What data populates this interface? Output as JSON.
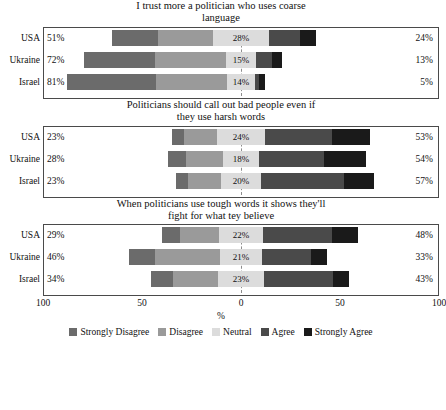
{
  "chart_data": {
    "type": "bar",
    "subtype": "diverging-stacked-likert",
    "title": "",
    "xlabel": "%",
    "ylabel": "",
    "xlim": [
      -100,
      100
    ],
    "xticks": [
      -100,
      -50,
      0,
      50,
      100
    ],
    "xticklabels": [
      "100",
      "50",
      "0",
      "50",
      "100"
    ],
    "grid": false,
    "legend_position": "bottom",
    "legend": [
      {
        "name": "Strongly Disagree",
        "color": "#6b6b6b"
      },
      {
        "name": "Disagree",
        "color": "#9a9a9a"
      },
      {
        "name": "Neutral",
        "color": "#dcdcdc"
      },
      {
        "name": "Agree",
        "color": "#4a4a4a"
      },
      {
        "name": "Strongly Agree",
        "color": "#1a1a1a"
      }
    ],
    "categories": [
      "USA",
      "Ukraine",
      "Israel"
    ],
    "panels": [
      {
        "title_lines": [
          "I trust more a politician who uses coarse",
          "language"
        ],
        "title": "I trust more a politician who uses coarse language",
        "rows": [
          {
            "category": "USA",
            "disagree_total_label": "51%",
            "neutral_label": "28%",
            "agree_total_label": "24%",
            "values": {
              "strongly_disagree": 23,
              "disagree": 28,
              "neutral": 28,
              "agree": 16,
              "strongly_agree": 8
            }
          },
          {
            "category": "Ukraine",
            "disagree_total_label": "72%",
            "neutral_label": "15%",
            "agree_total_label": "13%",
            "values": {
              "strongly_disagree": 36,
              "disagree": 36,
              "neutral": 15,
              "agree": 8,
              "strongly_agree": 5
            }
          },
          {
            "category": "Israel",
            "disagree_total_label": "81%",
            "neutral_label": "14%",
            "agree_total_label": "5%",
            "values": {
              "strongly_disagree": 45,
              "disagree": 36,
              "neutral": 14,
              "agree": 2,
              "strongly_agree": 3
            }
          }
        ]
      },
      {
        "title_lines": [
          "Politicians should call out  bad people even if",
          "they use harsh words"
        ],
        "title": "Politicians should call out  bad people even if they use harsh words",
        "rows": [
          {
            "category": "USA",
            "disagree_total_label": "23%",
            "neutral_label": "24%",
            "agree_total_label": "53%",
            "values": {
              "strongly_disagree": 6,
              "disagree": 17,
              "neutral": 24,
              "agree": 34,
              "strongly_agree": 19
            }
          },
          {
            "category": "Ukraine",
            "disagree_total_label": "28%",
            "neutral_label": "18%",
            "agree_total_label": "54%",
            "values": {
              "strongly_disagree": 9,
              "disagree": 19,
              "neutral": 18,
              "agree": 33,
              "strongly_agree": 21
            }
          },
          {
            "category": "Israel",
            "disagree_total_label": "23%",
            "neutral_label": "20%",
            "agree_total_label": "57%",
            "values": {
              "strongly_disagree": 6,
              "disagree": 17,
              "neutral": 20,
              "agree": 42,
              "strongly_agree": 15
            }
          }
        ]
      },
      {
        "title_lines": [
          "When politicians use tough words it shows they'll",
          "fight for what tey believe"
        ],
        "title": "When politicians use tough words it shows they'll fight for what tey believe",
        "rows": [
          {
            "category": "USA",
            "disagree_total_label": "29%",
            "neutral_label": "22%",
            "agree_total_label": "48%",
            "values": {
              "strongly_disagree": 9,
              "disagree": 20,
              "neutral": 22,
              "agree": 35,
              "strongly_agree": 13
            }
          },
          {
            "category": "Ukraine",
            "disagree_total_label": "46%",
            "neutral_label": "21%",
            "agree_total_label": "33%",
            "values": {
              "strongly_disagree": 13,
              "disagree": 33,
              "neutral": 21,
              "agree": 25,
              "strongly_agree": 8
            }
          },
          {
            "category": "Israel",
            "disagree_total_label": "34%",
            "neutral_label": "23%",
            "agree_total_label": "43%",
            "values": {
              "strongly_disagree": 11,
              "disagree": 23,
              "neutral": 23,
              "agree": 35,
              "strongly_agree": 8
            }
          }
        ]
      }
    ]
  }
}
